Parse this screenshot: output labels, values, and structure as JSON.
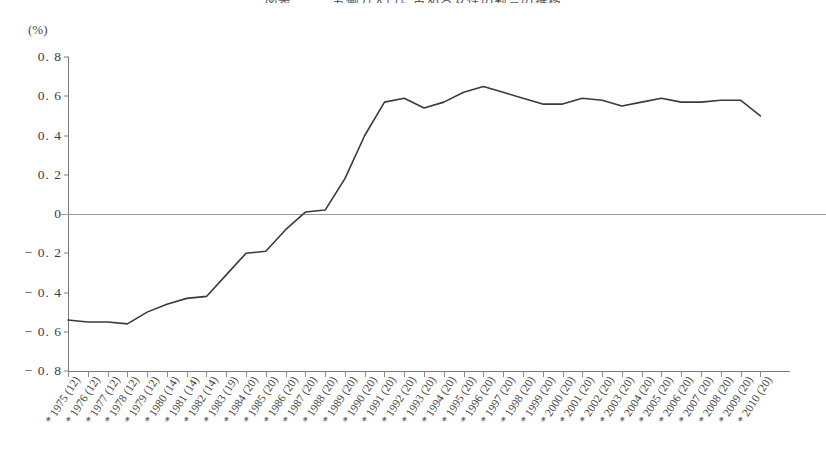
{
  "figure": {
    "title": "図表　　　労働力人口に占める女性の割合の推移",
    "unit_label": "(%)"
  },
  "chart_data": {
    "type": "line",
    "title": "図表　　　労働力人口に占める女性の割合の推移",
    "xlabel": "",
    "ylabel": "(%)",
    "ylim": [
      -0.8,
      0.8
    ],
    "ytick_values": [
      0.8,
      0.6,
      0.4,
      0.2,
      0,
      -0.2,
      -0.4,
      -0.6,
      -0.8
    ],
    "ytick_labels": [
      "0. 8",
      "0. 6",
      "0. 4",
      "0. 2",
      "0",
      "− 0. 2",
      "− 0. 4",
      "− 0. 6",
      "− 0. 8"
    ],
    "grid": false,
    "legend": "none",
    "zero_line": true,
    "categories": [
      "1975 (12)",
      "1976 (12)",
      "1977 (12)",
      "1978 (12)",
      "1979 (12)",
      "1980 (14)",
      "1981 (14)",
      "1982 (14)",
      "1983 (19)",
      "1984 (20)",
      "1985 (20)",
      "1986 (20)",
      "1987 (20)",
      "1988 (20)",
      "1989 (20)",
      "1990 (20)",
      "1991 (20)",
      "1992 (20)",
      "1993 (20)",
      "1994 (20)",
      "1995 (20)",
      "1996 (20)",
      "1997 (20)",
      "1998 (20)",
      "1999 (20)",
      "2000 (20)",
      "2001 (20)",
      "2002 (20)",
      "2003 (20)",
      "2004 (20)",
      "2005 (20)",
      "2006 (20)",
      "2007 (20)",
      "2008 (20)",
      "2009 (20)",
      "2010 (20)"
    ],
    "category_marks": [
      "*",
      "*",
      "*",
      "*",
      "*",
      "*",
      "*",
      "*",
      "*",
      "*",
      "*",
      "*",
      "*",
      "*",
      "*",
      "*",
      "*",
      "*",
      "*",
      "*",
      "*",
      "*",
      "*",
      "*",
      "*",
      "*",
      "*",
      "*",
      "*",
      "*",
      "*",
      "*",
      "*",
      "*",
      "*",
      "*"
    ],
    "series": [
      {
        "name": "割合",
        "color": "#3a3a3a",
        "values": [
          -0.54,
          -0.55,
          -0.55,
          -0.56,
          -0.5,
          -0.46,
          -0.43,
          -0.42,
          -0.31,
          -0.2,
          -0.19,
          -0.08,
          0.01,
          0.02,
          0.18,
          0.4,
          0.57,
          0.59,
          0.54,
          0.57,
          0.62,
          0.65,
          0.62,
          0.59,
          0.56,
          0.56,
          0.59,
          0.58,
          0.55,
          0.57,
          0.59,
          0.57,
          0.57,
          0.58,
          0.58,
          0.5
        ]
      }
    ]
  }
}
